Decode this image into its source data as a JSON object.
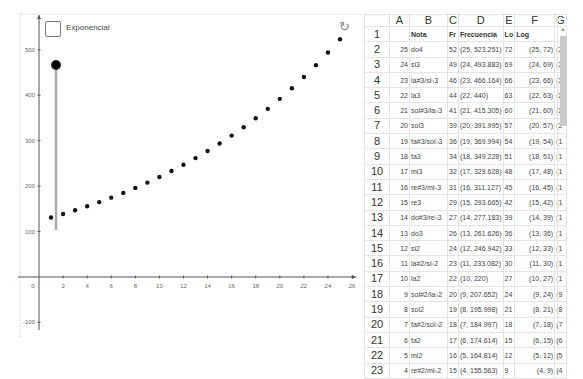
{
  "graphics": {
    "checkbox_label": "Exponencial",
    "checkbox_checked": false,
    "reset_icon": "↻",
    "slider": {
      "x": 56,
      "top": 65,
      "bottom": 230
    }
  },
  "chart_data": {
    "type": "scatter",
    "title": "",
    "xlabel": "",
    "ylabel": "",
    "xlim": [
      -2.5,
      26.5
    ],
    "ylim": [
      -110,
      610
    ],
    "grid": false,
    "x_ticks": [
      "0",
      "2",
      "4",
      "6",
      "8",
      "10",
      "12",
      "14",
      "16",
      "18",
      "20",
      "22",
      "24",
      "26"
    ],
    "y_ticks": [
      "-100",
      "100",
      "200",
      "300",
      "400",
      "500"
    ],
    "x": [
      1,
      2,
      3,
      4,
      5,
      6,
      7,
      8,
      9,
      10,
      11,
      12,
      13,
      14,
      15,
      16,
      17,
      18,
      19,
      20,
      21,
      22,
      23,
      24,
      25
    ],
    "y": [
      130.813,
      138.591,
      146.832,
      155.563,
      164.814,
      174.614,
      184.997,
      195.998,
      207.652,
      220,
      233.082,
      246.942,
      261.626,
      277.183,
      293.665,
      311.127,
      329.628,
      349.228,
      369.994,
      391.995,
      415.305,
      440,
      466.164,
      493.883,
      523.251
    ]
  },
  "spreadsheet": {
    "columns": [
      "A",
      "B",
      "C",
      "D",
      "E",
      "F",
      "G"
    ],
    "header_row": {
      "num": "1",
      "A": "",
      "B": "Nota",
      "C": "Fr",
      "D": "Frecuencia",
      "E": "Lo",
      "F": "Log",
      "G": ""
    },
    "rows": [
      {
        "num": "2",
        "A": "25",
        "B": "do4",
        "C": "52",
        "D": "(25, 523.251)",
        "E": "72",
        "F": "(25, 72)",
        "G": "(2"
      },
      {
        "num": "3",
        "A": "24",
        "B": "si3",
        "C": "49",
        "D": "(24, 493.883)",
        "E": "69",
        "F": "(24, 69)",
        "G": "(2"
      },
      {
        "num": "4",
        "A": "23",
        "B": "la#3/si♭3",
        "C": "46",
        "D": "(23, 466.164)",
        "E": "66",
        "F": "(23, 66)",
        "G": "(2"
      },
      {
        "num": "5",
        "A": "22",
        "B": "la3",
        "C": "44",
        "D": "(22, 440)",
        "E": "63",
        "F": "(22, 63)",
        "G": "(2"
      },
      {
        "num": "6",
        "A": "21",
        "B": "sol#3/la♭3",
        "C": "41",
        "D": "(21, 415.305)",
        "E": "60",
        "F": "(21, 60)",
        "G": "(2"
      },
      {
        "num": "7",
        "A": "20",
        "B": "sol3",
        "C": "39",
        "D": "(20, 391.995)",
        "E": "57",
        "F": "(20, 57)",
        "G": "(2"
      },
      {
        "num": "8",
        "A": "19",
        "B": "fa#3/sol♭3",
        "C": "36",
        "D": "(19, 369.994)",
        "E": "54",
        "F": "(19, 54)",
        "G": "(1"
      },
      {
        "num": "9",
        "A": "18",
        "B": "fa3",
        "C": "34",
        "D": "(18, 349.228)",
        "E": "51",
        "F": "(18, 51)",
        "G": "(1"
      },
      {
        "num": "10",
        "A": "17",
        "B": "mi3",
        "C": "32",
        "D": "(17, 329.628)",
        "E": "48",
        "F": "(17, 48)",
        "G": "(1"
      },
      {
        "num": "11",
        "A": "16",
        "B": "re#3/mi♭3",
        "C": "31",
        "D": "(16, 311.127)",
        "E": "45",
        "F": "(16, 45)",
        "G": "(1"
      },
      {
        "num": "12",
        "A": "15",
        "B": "re3",
        "C": "29",
        "D": "(15, 293.665)",
        "E": "42",
        "F": "(15, 42)",
        "G": "(1"
      },
      {
        "num": "13",
        "A": "14",
        "B": "do#3/re♭3",
        "C": "27",
        "D": "(14, 277.183)",
        "E": "39",
        "F": "(14, 39)",
        "G": "(1"
      },
      {
        "num": "14",
        "A": "13",
        "B": "do3",
        "C": "26",
        "D": "(13, 261.626)",
        "E": "36",
        "F": "(13, 36)",
        "G": "(1"
      },
      {
        "num": "15",
        "A": "12",
        "B": "si2",
        "C": "24",
        "D": "(12, 246.942)",
        "E": "33",
        "F": "(12, 33)",
        "G": "(1"
      },
      {
        "num": "16",
        "A": "11",
        "B": "la#2/si♭2",
        "C": "23",
        "D": "(11, 233.082)",
        "E": "30",
        "F": "(11, 30)",
        "G": "(1"
      },
      {
        "num": "17",
        "A": "10",
        "B": "la2",
        "C": "22",
        "D": "(10, 220)",
        "E": "27",
        "F": "(10, 27)",
        "G": "(1"
      },
      {
        "num": "18",
        "A": "9",
        "B": "sol#2/la♭2",
        "C": "20",
        "D": "(9, 207.652)",
        "E": "24",
        "F": "(9, 24)",
        "G": "(9"
      },
      {
        "num": "19",
        "A": "8",
        "B": "sol2",
        "C": "19",
        "D": "(8, 195.998)",
        "E": "21",
        "F": "(8, 21)",
        "G": "(8"
      },
      {
        "num": "20",
        "A": "7",
        "B": "fa#2/sol♭2",
        "C": "18",
        "D": "(7, 184.997)",
        "E": "18",
        "F": "(7, 18)",
        "G": "(7"
      },
      {
        "num": "21",
        "A": "6",
        "B": "fa2",
        "C": "17",
        "D": "(6, 174.614)",
        "E": "15",
        "F": "(6, 15)",
        "G": "(6"
      },
      {
        "num": "22",
        "A": "5",
        "B": "mi2",
        "C": "16",
        "D": "(5, 164.814)",
        "E": "12",
        "F": "(5, 12)",
        "G": "(5"
      },
      {
        "num": "23",
        "A": "4",
        "B": "re#2/mi♭2",
        "C": "15",
        "D": "(4, 155.563)",
        "E": "9",
        "F": "(4, 9)",
        "G": "(4"
      }
    ]
  }
}
